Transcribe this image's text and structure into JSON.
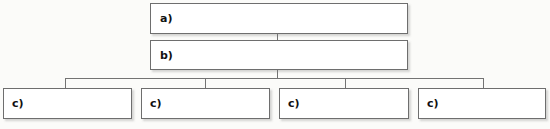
{
  "diagram": {
    "type": "hierarchy-tree",
    "orientation": "top-down",
    "levels": 3,
    "line_color": "#737373",
    "box_border_color": "#6e6e6e",
    "box_fill_color": "#ffffff",
    "background_color": "#fbfbf9",
    "fill_in_style": "dotted-blank-line",
    "nodes": {
      "level1": [
        {
          "label": "a)",
          "value": "",
          "blank": true
        }
      ],
      "level2": [
        {
          "label": "b)",
          "value": "",
          "blank": true
        }
      ],
      "level3": [
        {
          "label": "c)",
          "value": "",
          "blank": true
        },
        {
          "label": "c)",
          "value": "",
          "blank": true
        },
        {
          "label": "c)",
          "value": "",
          "blank": true
        },
        {
          "label": "c)",
          "value": "",
          "blank": true
        }
      ]
    }
  }
}
